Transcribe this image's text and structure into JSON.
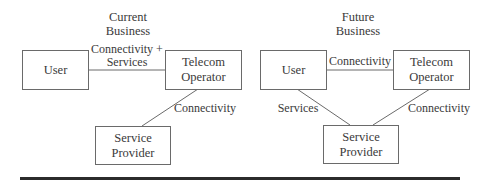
{
  "diagrams": [
    {
      "title_line1": "Current",
      "title_line2": "Business",
      "nodes": {
        "user": {
          "label": "User"
        },
        "telecom": {
          "line1": "Telecom",
          "line2": "Operator"
        },
        "provider": {
          "line1": "Service",
          "line2": "Provider"
        }
      },
      "edges": {
        "user_telecom_line1": "Connectivity +",
        "user_telecom_line2": "Services",
        "telecom_provider": "Connectivity"
      }
    },
    {
      "title_line1": "Future",
      "title_line2": "Business",
      "nodes": {
        "user": {
          "label": "User"
        },
        "telecom": {
          "line1": "Telecom",
          "line2": "Operator"
        },
        "provider": {
          "line1": "Service",
          "line2": "Provider"
        }
      },
      "edges": {
        "user_telecom": "Connectivity",
        "user_provider": "Services",
        "telecom_provider": "Connectivity"
      }
    }
  ],
  "colors": {
    "box_border": "#6a6a6a",
    "line": "#6a6a6a",
    "text": "#3a3a3a",
    "rule": "#2b2b2b"
  }
}
